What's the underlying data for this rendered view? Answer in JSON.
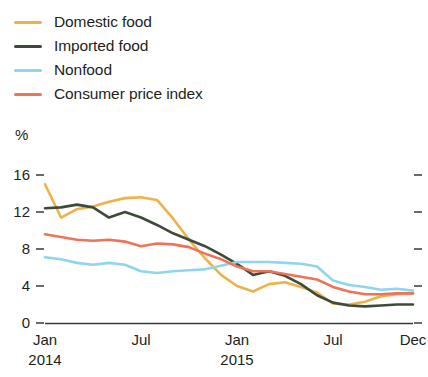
{
  "legend": {
    "position": "top-left",
    "items": [
      {
        "label": "Domestic food",
        "color": "#EDB24A",
        "key": "domestic_food"
      },
      {
        "label": "Imported food",
        "color": "#3E4A3A",
        "key": "imported_food"
      },
      {
        "label": "Nonfood",
        "color": "#90D5EF",
        "key": "nonfood"
      },
      {
        "label": "Consumer price index",
        "color": "#F07257",
        "key": "cpi"
      }
    ]
  },
  "axes": {
    "y_unit": "%",
    "y_ticks": [
      "0",
      "4",
      "8",
      "12",
      "16"
    ],
    "x_ticks": [
      {
        "label": "Jan",
        "sub": "2014"
      },
      {
        "label": "Jul",
        "sub": ""
      },
      {
        "label": "Jan",
        "sub": "2015"
      },
      {
        "label": "Jul",
        "sub": ""
      },
      {
        "label": "Dec",
        "sub": ""
      }
    ]
  },
  "chart_data": {
    "type": "line",
    "title": "",
    "subtitle": "",
    "xlabel": "",
    "ylabel": "%",
    "ylim": [
      0,
      17
    ],
    "xlim": [
      0,
      23
    ],
    "grid": false,
    "legend_position": "top-left",
    "x": [
      "Jan 2014",
      "Feb 2014",
      "Mar 2014",
      "Apr 2014",
      "May 2014",
      "Jun 2014",
      "Jul 2014",
      "Aug 2014",
      "Sep 2014",
      "Oct 2014",
      "Nov 2014",
      "Dec 2014",
      "Jan 2015",
      "Feb 2015",
      "Mar 2015",
      "Apr 2015",
      "May 2015",
      "Jun 2015",
      "Jul 2015",
      "Aug 2015",
      "Sep 2015",
      "Oct 2015",
      "Nov 2015",
      "Dec 2015"
    ],
    "tick_labels": [
      "Jan 2014",
      "Jul",
      "Jan 2015",
      "Jul",
      "Dec"
    ],
    "tick_indices": [
      0,
      6,
      12,
      18,
      23
    ],
    "series": [
      {
        "name": "Domestic food",
        "color": "#EDB24A",
        "values": [
          15.0,
          11.4,
          12.3,
          12.6,
          13.1,
          13.5,
          13.6,
          13.3,
          11.3,
          9.0,
          7.0,
          5.2,
          4.0,
          3.4,
          4.2,
          4.4,
          3.9,
          3.3,
          2.1,
          2.0,
          2.3,
          2.9,
          3.1,
          3.2
        ]
      },
      {
        "name": "Imported food",
        "color": "#3E4A3A",
        "values": [
          12.4,
          12.5,
          12.8,
          12.5,
          11.4,
          12.0,
          11.4,
          10.6,
          9.7,
          9.0,
          8.3,
          7.4,
          6.4,
          5.2,
          5.6,
          5.1,
          4.2,
          3.0,
          2.2,
          1.9,
          1.8,
          1.9,
          2.0,
          2.0
        ]
      },
      {
        "name": "Nonfood",
        "color": "#90D5EF",
        "values": [
          7.1,
          6.9,
          6.5,
          6.3,
          6.5,
          6.3,
          5.6,
          5.4,
          5.6,
          5.7,
          5.8,
          6.2,
          6.6,
          6.6,
          6.6,
          6.5,
          6.4,
          6.1,
          4.6,
          4.1,
          3.9,
          3.6,
          3.7,
          3.5
        ]
      },
      {
        "name": "Consumer price index",
        "color": "#F07257",
        "values": [
          9.6,
          9.3,
          9.0,
          8.9,
          9.0,
          8.8,
          8.3,
          8.6,
          8.5,
          8.2,
          7.5,
          6.9,
          6.1,
          5.6,
          5.6,
          5.3,
          5.0,
          4.7,
          3.9,
          3.4,
          3.1,
          3.1,
          3.2,
          3.2
        ]
      }
    ]
  }
}
